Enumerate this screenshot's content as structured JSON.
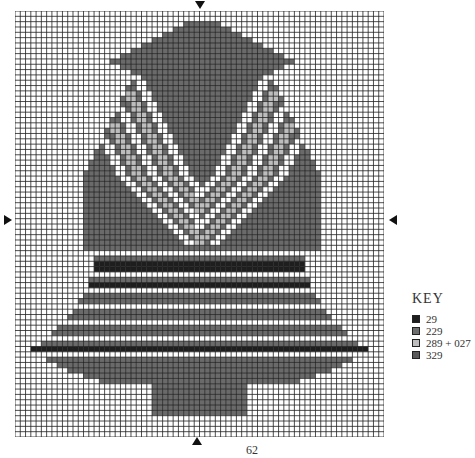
{
  "page": {
    "number": "62"
  },
  "key": {
    "title": "KEY",
    "items": [
      {
        "label": "29",
        "color": "#1e1e1e"
      },
      {
        "label": "229",
        "color": "#6e6e6e"
      },
      {
        "label": "289 + 027",
        "color": "#bdbdbd"
      },
      {
        "label": "329",
        "color": "#5a5a5a"
      }
    ]
  },
  "grid": {
    "cols": 70,
    "rows": 80,
    "cell": 5.27
  }
}
